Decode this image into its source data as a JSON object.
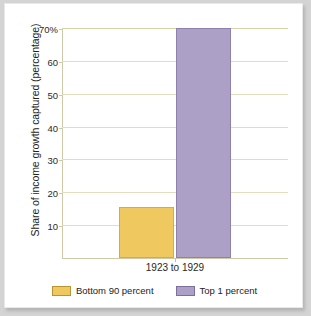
{
  "chart_data": {
    "type": "bar",
    "title": "",
    "xlabel": "",
    "ylabel": "Share of income growth captured (percentage)",
    "categories": [
      "1923 to 1929"
    ],
    "series": [
      {
        "name": "Bottom 90 percent",
        "values": [
          15.5
        ],
        "color": "#efc860"
      },
      {
        "name": "Top 1 percent",
        "values": [
          70
        ],
        "color": "#aca0c6"
      }
    ],
    "ylim": [
      0,
      70
    ],
    "yticks": [
      10,
      20,
      30,
      40,
      50,
      60,
      70
    ],
    "ytick_labels": [
      "10",
      "20",
      "30",
      "40",
      "50",
      "60",
      "70%"
    ],
    "grid": true,
    "legend_position": "bottom",
    "gridline_color": "#e2ddbe",
    "background_color": "#ffffff"
  },
  "axis": {
    "y_title": "Share of income growth captured (percentage)"
  },
  "category_label": "1923 to 1929",
  "legend": {
    "items": [
      {
        "label": "Bottom 90 percent"
      },
      {
        "label": "Top 1 percent"
      }
    ]
  }
}
